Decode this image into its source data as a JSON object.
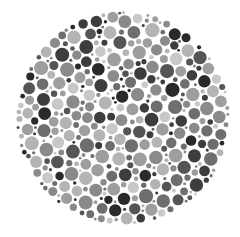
{
  "plate": {
    "type": "dot-pattern-plate",
    "center": [
      123,
      118
    ],
    "radius": 107,
    "background": "#ffffff",
    "palette": [
      "#2a2a2a",
      "#3d3d3d",
      "#555555",
      "#6e6e6e",
      "#8a8a8a",
      "#9e9e9e",
      "#b4b4b4",
      "#c8c8c8"
    ],
    "palette_weights": [
      1.0,
      1.1,
      1.4,
      1.6,
      1.8,
      1.6,
      1.4,
      0.9
    ],
    "dot_radius_range": [
      1.6,
      6.2
    ],
    "dot_count_target": 900,
    "seed": 1337
  }
}
